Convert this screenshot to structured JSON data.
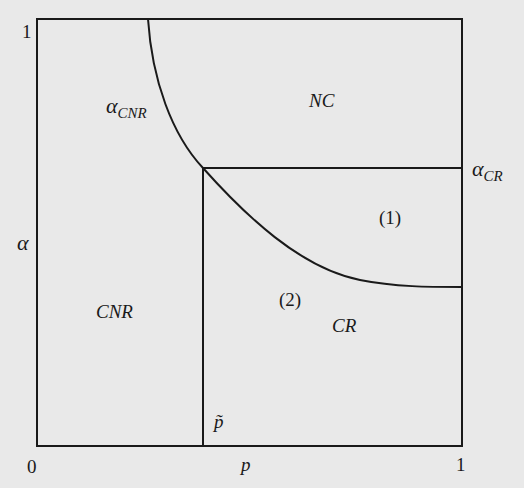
{
  "diagram": {
    "type": "region-partition",
    "background_color": "#e9e9e9",
    "line_color": "#1a1a1a",
    "axes": {
      "x_label": "p",
      "y_label": "α",
      "x_ticks": [
        "0",
        "1"
      ],
      "y_ticks": [
        "1"
      ],
      "x_range": [
        0,
        1
      ],
      "y_range": [
        0,
        1
      ]
    },
    "markers": {
      "p_tilde": "p̃",
      "alpha_cr_symbol": "α",
      "alpha_cr_subscript": "CR",
      "alpha_cnr_symbol": "α",
      "alpha_cnr_subscript": "CNR"
    },
    "regions": {
      "nc": "NC",
      "cnr": "CNR",
      "cr": "CR",
      "sub1": "(1)",
      "sub2": "(2)"
    },
    "curves": [
      {
        "name": "alpha_CNR boundary",
        "from": [
          0.26,
          1.0
        ],
        "through": [
          0.39,
          0.65
        ],
        "to": [
          1.0,
          0.37
        ]
      },
      {
        "name": "alpha_CR horizontal",
        "from": [
          0.39,
          0.65
        ],
        "to": [
          1.0,
          0.65
        ]
      },
      {
        "name": "p_tilde vertical",
        "from": [
          0.39,
          0.0
        ],
        "to": [
          0.39,
          0.65
        ]
      }
    ]
  }
}
